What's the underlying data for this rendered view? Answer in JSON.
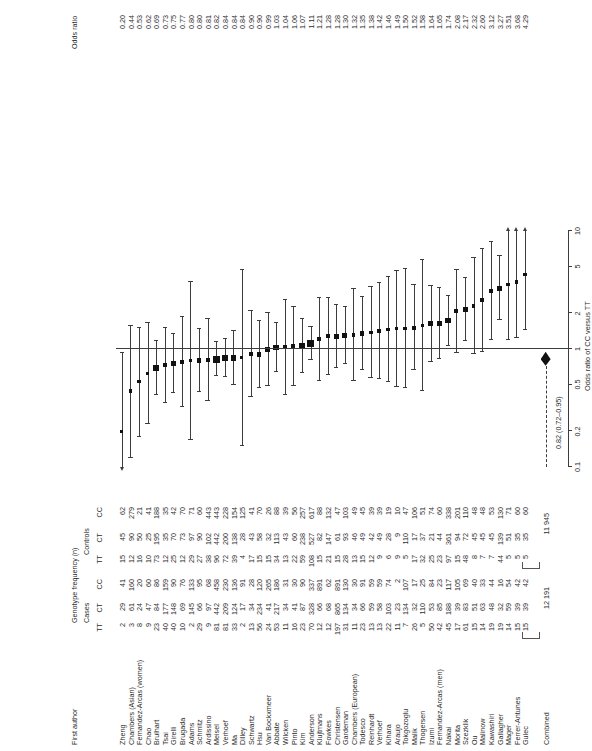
{
  "figure": {
    "type": "forest-plot",
    "orientation": "rotated-90-ccw",
    "headers": {
      "author": "First author",
      "genotype_group": "Genotype frequency (n)",
      "cases": "Cases",
      "controls": "Controls",
      "cases_tt": "TT",
      "cases_ct": "CT",
      "cases_cc": "CC",
      "controls_tt": "TT",
      "controls_ct": "CT",
      "controls_cc": "CC",
      "odds_ratio": "Odds ratio"
    },
    "axis_title": "Odds ratio of CC versus TT",
    "totals": {
      "cases": "12 191",
      "controls": "11 945"
    },
    "combined_label": "Combined",
    "summary_text": "0.82 (0.72–0.95)"
  },
  "chart_data": {
    "type": "forest",
    "title": "",
    "xlabel": "Odds ratio of CC versus TT",
    "ylabel": "",
    "xscale": "log",
    "xlim": [
      0.1,
      10
    ],
    "xticks": [
      0.1,
      0.2,
      0.5,
      1,
      2,
      5,
      10
    ],
    "xticklabels": [
      "0.1",
      "0.2",
      "0.5",
      "1",
      "2",
      "5",
      "10"
    ],
    "null_value": 1,
    "grid": false,
    "legend": "none",
    "summary": {
      "label": "Combined",
      "or": 0.82,
      "ci_low": 0.72,
      "ci_high": 0.95,
      "text": "0.82 (0.72–0.95)"
    },
    "columns": [
      "First author",
      "Cases TT",
      "Cases CT",
      "Cases CC",
      "Controls TT",
      "Controls CT",
      "Controls CC",
      "Odds ratio"
    ],
    "rows": [
      {
        "author": "Zheng",
        "ctt": "2",
        "cct": "29",
        "ccc": "41",
        "ntt": "15",
        "nct": "45",
        "ncc": "62",
        "or": "0.20",
        "orv": 0.2,
        "lo": 0.04,
        "hi": 0.92,
        "w": 3.0
      },
      {
        "author": "Chambers (Asian)",
        "ctt": "3",
        "cct": "61",
        "ccc": "160",
        "ntt": "12",
        "nct": "90",
        "ncc": "279",
        "or": "0.44",
        "orv": 0.44,
        "lo": 0.12,
        "hi": 1.58,
        "w": 3.4
      },
      {
        "author": "Fernandez-Arcas (women)",
        "ctt": "8",
        "cct": "24",
        "ccc": "20",
        "ntt": "16",
        "nct": "50",
        "ncc": "21",
        "or": "0.53",
        "orv": 0.53,
        "lo": 0.18,
        "hi": 1.52,
        "w": 3.6
      },
      {
        "author": "Chao",
        "ctt": "9",
        "cct": "47",
        "ccc": "60",
        "ntt": "10",
        "nct": "25",
        "ncc": "41",
        "or": "0.62",
        "orv": 0.62,
        "lo": 0.23,
        "hi": 1.66,
        "w": 3.8
      },
      {
        "author": "Brulhart",
        "ctt": "23",
        "cct": "84",
        "ccc": "86",
        "ntt": "73",
        "nct": "195",
        "ncc": "188",
        "or": "0.69",
        "orv": 0.69,
        "lo": 0.41,
        "hi": 1.16,
        "w": 5.4
      },
      {
        "author": "Tsai",
        "ctt": "40",
        "cct": "177",
        "ccc": "159",
        "ntt": "12",
        "nct": "35",
        "ncc": "35",
        "or": "0.73",
        "orv": 0.73,
        "lo": 0.35,
        "hi": 1.52,
        "w": 4.4
      },
      {
        "author": "Girelli",
        "ctt": "40",
        "cct": "148",
        "ccc": "90",
        "ntt": "25",
        "nct": "70",
        "ncc": "42",
        "or": "0.75",
        "orv": 0.75,
        "lo": 0.42,
        "hi": 1.34,
        "w": 5.0
      },
      {
        "author": "Brugada",
        "ctt": "10",
        "cct": "69",
        "ccc": "76",
        "ntt": "12",
        "nct": "73",
        "ncc": "70",
        "or": "0.77",
        "orv": 0.77,
        "lo": 0.32,
        "hi": 1.87,
        "w": 4.0
      },
      {
        "author": "Adams",
        "ctt": "2",
        "cct": "145",
        "ccc": "133",
        "ntt": "29",
        "nct": "97",
        "ncc": "71",
        "or": "0.80",
        "orv": 0.8,
        "lo": 0.17,
        "hi": 3.7,
        "w": 3.2
      },
      {
        "author": "Schmitz",
        "ctt": "29",
        "cct": "66",
        "ccc": "95",
        "ntt": "27",
        "nct": "90",
        "ncc": "60",
        "or": "0.80",
        "orv": 0.8,
        "lo": 0.43,
        "hi": 1.49,
        "w": 4.8
      },
      {
        "author": "Ardissino",
        "ctt": "9",
        "cct": "97",
        "ccc": "68",
        "ntt": "38",
        "nct": "102",
        "ncc": "443",
        "or": "0.81",
        "orv": 0.81,
        "lo": 0.36,
        "hi": 1.81,
        "w": 4.2
      },
      {
        "author": "Meisel",
        "ctt": "81",
        "cct": "442",
        "ccc": "458",
        "ntt": "96",
        "nct": "442",
        "ncc": "443",
        "or": "0.82",
        "orv": 0.82,
        "lo": 0.59,
        "hi": 1.14,
        "w": 7.0
      },
      {
        "author": "Verhoef",
        "ctt": "81",
        "cct": "209",
        "ccc": "230",
        "ntt": "72",
        "nct": "200",
        "ncc": "228",
        "or": "0.84",
        "orv": 0.84,
        "lo": 0.58,
        "hi": 1.21,
        "w": 6.4
      },
      {
        "author": "Ma",
        "ctt": "33",
        "cct": "124",
        "ccc": "136",
        "ntt": "39",
        "nct": "138",
        "ncc": "154",
        "or": "0.84",
        "orv": 0.84,
        "lo": 0.5,
        "hi": 1.41,
        "w": 5.4
      },
      {
        "author": "Dilley",
        "ctt": "2",
        "cct": "17",
        "ccc": "91",
        "ntt": "4",
        "nct": "28",
        "ncc": "125",
        "or": "0.84",
        "orv": 0.84,
        "lo": 0.15,
        "hi": 4.7,
        "w": 3.0
      },
      {
        "author": "Schwartz",
        "ctt": "13",
        "cct": "34",
        "ccc": "28",
        "ntt": "17",
        "nct": "43",
        "ncc": "41",
        "or": "0.90",
        "orv": 0.9,
        "lo": 0.39,
        "hi": 2.1,
        "w": 4.0
      },
      {
        "author": "Hsu",
        "ctt": "56",
        "cct": "234",
        "ccc": "120",
        "ntt": "15",
        "nct": "58",
        "ncc": "70",
        "or": "0.90",
        "orv": 0.9,
        "lo": 0.47,
        "hi": 1.73,
        "w": 4.8
      },
      {
        "author": "Van Bockxmeer",
        "ctt": "24",
        "cct": "41",
        "ccc": "265",
        "ntt": "15",
        "nct": "32",
        "ncc": "26",
        "or": "0.99",
        "orv": 0.99,
        "lo": 0.49,
        "hi": 2.0,
        "w": 4.6
      },
      {
        "author": "Abbate",
        "ctt": "53",
        "cct": "217",
        "ccc": "186",
        "ntt": "34",
        "nct": "113",
        "ncc": "88",
        "or": "1.03",
        "orv": 1.03,
        "lo": 0.64,
        "hi": 1.65,
        "w": 5.6
      },
      {
        "author": "Wilcken",
        "ctt": "11",
        "cct": "34",
        "ccc": "31",
        "ntt": "13",
        "nct": "43",
        "ncc": "39",
        "or": "1.04",
        "orv": 1.04,
        "lo": 0.41,
        "hi": 2.62,
        "w": 3.8
      },
      {
        "author": "Pinto",
        "ctt": "16",
        "cct": "41",
        "ccc": "30",
        "ntt": "22",
        "nct": "60",
        "ncc": "56",
        "or": "1.06",
        "orv": 1.06,
        "lo": 0.49,
        "hi": 2.28,
        "w": 4.2
      },
      {
        "author": "Kim",
        "ctt": "23",
        "cct": "87",
        "ccc": "90",
        "ntt": "59",
        "nct": "238",
        "ncc": "257",
        "or": "1.07",
        "orv": 1.07,
        "lo": 0.63,
        "hi": 1.81,
        "w": 5.4
      },
      {
        "author": "Anderson",
        "ctt": "70",
        "cct": "328",
        "ccc": "337",
        "ntt": "108",
        "nct": "527",
        "ncc": "617",
        "or": "1.11",
        "orv": 1.11,
        "lo": 0.8,
        "hi": 1.54,
        "w": 6.6
      },
      {
        "author": "Klujtmans",
        "ctt": "12",
        "cct": "66",
        "ccc": "891",
        "ntt": "15",
        "nct": "82",
        "ncc": "88",
        "or": "1.21",
        "orv": 1.21,
        "lo": 0.54,
        "hi": 2.7,
        "w": 4.0
      },
      {
        "author": "Fowkes",
        "ctt": "12",
        "cct": "68",
        "ccc": "62",
        "ntt": "21",
        "nct": "147",
        "ncc": "132",
        "or": "1.28",
        "orv": 1.28,
        "lo": 0.6,
        "hi": 2.73,
        "w": 4.2
      },
      {
        "author": "Christensen",
        "ctt": "197",
        "cct": "865",
        "ccc": "891",
        "ntt": "15",
        "nct": "61",
        "ncc": "47",
        "or": "1.28",
        "orv": 1.28,
        "lo": 0.69,
        "hi": 2.37,
        "w": 4.8
      },
      {
        "author": "Gardeman",
        "ctt": "31",
        "cct": "134",
        "ccc": "130",
        "ntt": "28",
        "nct": "93",
        "ncc": "103",
        "or": "1.30",
        "orv": 1.3,
        "lo": 0.74,
        "hi": 2.28,
        "w": 5.0
      },
      {
        "author": "Chambers (European)",
        "ctt": "11",
        "cct": "34",
        "ccc": "30",
        "ntt": "13",
        "nct": "46",
        "ncc": "49",
        "or": "1.32",
        "orv": 1.32,
        "lo": 0.54,
        "hi": 3.22,
        "w": 3.8
      },
      {
        "author": "Todesco",
        "ctt": "23",
        "cct": "66",
        "ccc": "91",
        "ntt": "15",
        "nct": "49",
        "ncc": "45",
        "or": "1.35",
        "orv": 1.35,
        "lo": 0.66,
        "hi": 2.76,
        "w": 4.4
      },
      {
        "author": "Reinhardt",
        "ctt": "13",
        "cct": "59",
        "ccc": "59",
        "ntt": "12",
        "nct": "42",
        "ncc": "39",
        "or": "1.38",
        "orv": 1.38,
        "lo": 0.57,
        "hi": 3.35,
        "w": 3.8
      },
      {
        "author": "Verhoef",
        "ctt": "13",
        "cct": "58",
        "ccc": "59",
        "ntt": "9",
        "nct": "49",
        "ncc": "39",
        "or": "1.42",
        "orv": 1.42,
        "lo": 0.56,
        "hi": 3.6,
        "w": 3.8
      },
      {
        "author": "Kihara",
        "ctt": "22",
        "cct": "103",
        "ccc": "74",
        "ntt": "6",
        "nct": "28",
        "ncc": "19",
        "or": "1.46",
        "orv": 1.46,
        "lo": 0.53,
        "hi": 4.05,
        "w": 3.6
      },
      {
        "author": "Araujo",
        "ctt": "11",
        "cct": "23",
        "ccc": "2",
        "ntt": "9",
        "nct": "9",
        "ncc": "10",
        "or": "1.49",
        "orv": 1.49,
        "lo": 0.48,
        "hi": 4.6,
        "w": 3.4
      },
      {
        "author": "Tokgozoglu",
        "ctt": "7",
        "cct": "134",
        "ccc": "107",
        "ntt": "5",
        "nct": "110",
        "ncc": "47",
        "or": "1.50",
        "orv": 1.5,
        "lo": 0.47,
        "hi": 4.8,
        "w": 3.4
      },
      {
        "author": "Malik",
        "ctt": "26",
        "cct": "32",
        "ccc": "17",
        "ntt": "17",
        "nct": "17",
        "ncc": "106",
        "or": "1.52",
        "orv": 1.52,
        "lo": 0.66,
        "hi": 3.5,
        "w": 4.0
      },
      {
        "author": "Thogersen",
        "ctt": "5",
        "cct": "110",
        "ccc": "25",
        "ntt": "32",
        "nct": "37",
        "ncc": "51",
        "or": "1.58",
        "orv": 1.58,
        "lo": 0.44,
        "hi": 5.7,
        "w": 3.2
      },
      {
        "author": "Izumi",
        "ctt": "50",
        "cct": "53",
        "ccc": "84",
        "ntt": "25",
        "nct": "21",
        "ncc": "74",
        "or": "1.64",
        "orv": 1.64,
        "lo": 0.78,
        "hi": 3.44,
        "w": 4.4
      },
      {
        "author": "Fernandez-Arcas (men)",
        "ctt": "42",
        "cct": "85",
        "ccc": "23",
        "ntt": "23",
        "nct": "44",
        "ncc": "60",
        "or": "1.65",
        "orv": 1.65,
        "lo": 0.82,
        "hi": 3.32,
        "w": 4.6
      },
      {
        "author": "Nakai",
        "ctt": "45",
        "cct": "188",
        "ccc": "117",
        "ntt": "97",
        "nct": "361",
        "ncc": "338",
        "or": "1.74",
        "orv": 1.74,
        "lo": 1.07,
        "hi": 2.84,
        "w": 5.6
      },
      {
        "author": "Morita",
        "ctt": "17",
        "cct": "39",
        "ccc": "105",
        "ntt": "15",
        "nct": "94",
        "ncc": "201",
        "or": "2.08",
        "orv": 2.08,
        "lo": 0.92,
        "hi": 4.7,
        "w": 4.0
      },
      {
        "author": "Szezklik",
        "ctt": "61",
        "cct": "83",
        "ccc": "69",
        "ntt": "48",
        "nct": "72",
        "ncc": "110",
        "or": "2.17",
        "orv": 2.17,
        "lo": 1.18,
        "hi": 3.99,
        "w": 5.0
      },
      {
        "author": "Ou",
        "ctt": "15",
        "cct": "51",
        "ccc": "40",
        "ntt": "8",
        "nct": "45",
        "ncc": "48",
        "or": "2.32",
        "orv": 2.32,
        "lo": 0.9,
        "hi": 5.95,
        "w": 3.8
      },
      {
        "author": "Malinow",
        "ctt": "14",
        "cct": "63",
        "ccc": "33",
        "ntt": "7",
        "nct": "45",
        "ncc": "48",
        "or": "2.60",
        "orv": 2.6,
        "lo": 0.95,
        "hi": 7.1,
        "w": 3.6
      },
      {
        "author": "Kawashiri",
        "ctt": "19",
        "cct": "48",
        "ccc": "44",
        "ntt": "7",
        "nct": "45",
        "ncc": "53",
        "or": "3.12",
        "orv": 3.12,
        "lo": 1.2,
        "hi": 8.1,
        "w": 3.8
      },
      {
        "author": "Gallagher",
        "ctt": "19",
        "cct": "32",
        "ccc": "16",
        "ntt": "44",
        "nct": "139",
        "ncc": "130",
        "or": "3.27",
        "orv": 3.27,
        "lo": 1.75,
        "hi": 6.1,
        "w": 5.0
      },
      {
        "author": "Mager",
        "ctt": "14",
        "cct": "59",
        "ccc": "54",
        "ntt": "5",
        "nct": "51",
        "ncc": "71",
        "or": "3.51",
        "orv": 3.51,
        "lo": 1.2,
        "hi": 10.2,
        "w": 3.6
      },
      {
        "author": "Ferrer-Antunes",
        "ctt": "15",
        "cct": "39",
        "ccc": "42",
        "ntt": "5",
        "nct": "35",
        "ncc": "60",
        "or": "3.68",
        "orv": 3.68,
        "lo": 1.25,
        "hi": 10.8,
        "w": 3.6
      },
      {
        "author": "Gulec",
        "ctt": "15",
        "cct": "39",
        "ccc": "42",
        "ntt": "5",
        "nct": "35",
        "ncc": "60",
        "or": "4.29",
        "orv": 4.29,
        "lo": 1.45,
        "hi": 12.7,
        "w": 3.6
      }
    ]
  }
}
